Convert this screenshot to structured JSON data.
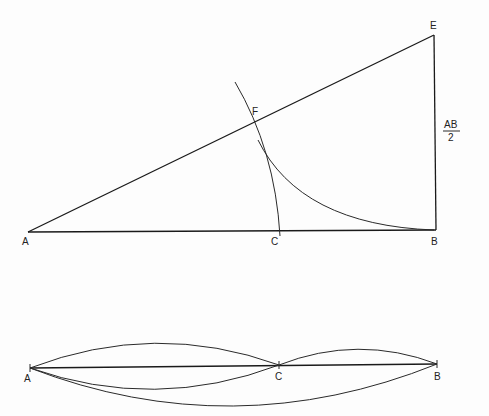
{
  "figure": {
    "top_construction": {
      "points": {
        "A": {
          "label": "A",
          "x": 28,
          "y": 232
        },
        "B": {
          "label": "B",
          "x": 436,
          "y": 230
        },
        "C": {
          "label": "C",
          "x": 280,
          "y": 232
        },
        "E": {
          "label": "E",
          "x": 434,
          "y": 35
        },
        "F": {
          "label": "F",
          "x": 252,
          "y": 123
        }
      },
      "side_label": {
        "numerator": "AB",
        "denominator": "2"
      }
    },
    "bottom_segment": {
      "points": {
        "A": {
          "label": "A",
          "x": 30,
          "y": 368
        },
        "C": {
          "label": "C",
          "x": 279,
          "y": 365
        },
        "B": {
          "label": "B",
          "x": 437,
          "y": 364
        }
      }
    }
  }
}
